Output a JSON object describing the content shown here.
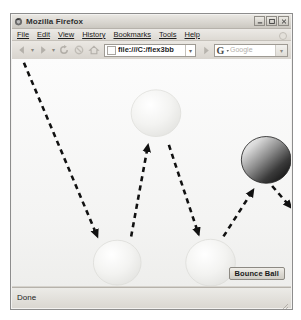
{
  "caption": {
    "text": ""
  },
  "window": {
    "title": "Mozilla Firefox",
    "app_icon": "firefox-icon",
    "controls": {
      "minimize_label": "–",
      "maximize_label": "▭",
      "close_label": "×"
    }
  },
  "menu_bar": {
    "items": [
      {
        "label": "File",
        "accel": "F"
      },
      {
        "label": "Edit",
        "accel": "E"
      },
      {
        "label": "View",
        "accel": "V"
      },
      {
        "label": "History",
        "accel": "s"
      },
      {
        "label": "Bookmarks",
        "accel": "B"
      },
      {
        "label": "Tools",
        "accel": "T"
      },
      {
        "label": "Help",
        "accel": "H"
      }
    ]
  },
  "toolbar": {
    "back_icon": "back-arrow-icon",
    "forward_icon": "forward-arrow-icon",
    "reload_icon": "reload-icon",
    "stop_icon": "stop-icon",
    "home_icon": "home-icon",
    "url_value": "file:///C:/flex3bb",
    "url_dropdown_glyph": "▾",
    "go_icon": "go-arrow-icon",
    "search_engine_glyph": "G",
    "search_placeholder": "Google",
    "search_dropdown_glyph": "▾"
  },
  "content": {
    "bounce_ball_button_label": "Bounce Ball",
    "balls": [
      {
        "name": "ball-top-middle",
        "cx": 145,
        "cy": 58,
        "r": 25,
        "style": "light"
      },
      {
        "name": "ball-bottom-left",
        "cx": 106,
        "cy": 218,
        "r": 24,
        "style": "light"
      },
      {
        "name": "ball-bottom-middle",
        "cx": 200,
        "cy": 218,
        "r": 25,
        "style": "light"
      },
      {
        "name": "ball-right-dark",
        "cx": 256,
        "cy": 108,
        "r": 25,
        "style": "dark"
      }
    ],
    "trajectory_arrows": [
      {
        "name": "arrow-1-down-left",
        "x1": 12,
        "y1": 4,
        "x2": 86,
        "y2": 190
      },
      {
        "name": "arrow-2-up-right",
        "x1": 120,
        "y1": 190,
        "x2": 137,
        "y2": 92
      },
      {
        "name": "arrow-3-down-right",
        "x1": 158,
        "y1": 92,
        "x2": 188,
        "y2": 188
      },
      {
        "name": "arrow-4-up-right",
        "x1": 213,
        "y1": 190,
        "x2": 243,
        "y2": 140
      },
      {
        "name": "arrow-5-down-right",
        "x1": 262,
        "y1": 136,
        "x2": 281,
        "y2": 157
      }
    ]
  },
  "status_bar": {
    "text": "Done",
    "resize_grip_icon": "resize-grip-icon"
  },
  "colors": {
    "chrome": "#d6d3cd",
    "title_text": "#2f2f2f",
    "canvas": "#fbfbfa",
    "ball_light": "#ededeb",
    "ball_dark": "#1d1d1d",
    "arrow": "#111111"
  }
}
